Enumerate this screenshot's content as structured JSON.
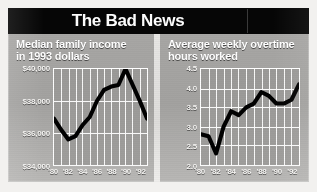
{
  "banner": {
    "title": "The Bad News"
  },
  "charts": [
    {
      "id": "median-family-income",
      "title": "Median family income\nin 1993 dollars"
    },
    {
      "id": "average-weekly-overtime",
      "title": "Average weekly overtime\nhours worked"
    }
  ],
  "chart_data": [
    {
      "type": "line",
      "id": "median-family-income",
      "title": "Median family income in 1993 dollars",
      "xlabel": "",
      "ylabel": "Median family income (1993 dollars)",
      "x": [
        1980,
        1981,
        1982,
        1983,
        1984,
        1985,
        1986,
        1987,
        1988,
        1989,
        1990,
        1991,
        1992,
        1993
      ],
      "values": [
        36900,
        36200,
        35600,
        35800,
        36500,
        37000,
        38000,
        38700,
        38900,
        39000,
        40000,
        39000,
        38000,
        36900
      ],
      "ytick_labels": [
        "$40,000",
        "$38,000",
        "$36,000",
        "$34,000"
      ],
      "ytick_values": [
        40000,
        38000,
        36000,
        34000
      ],
      "ylim": [
        34000,
        40000
      ],
      "xtick_labels": [
        "'80",
        "'82",
        "'84",
        "'86",
        "'88",
        "'90",
        "'92"
      ],
      "xtick_values": [
        1980,
        1982,
        1984,
        1986,
        1988,
        1990,
        1992
      ],
      "xlim": [
        1980,
        1993
      ],
      "grid": true,
      "legend": "none",
      "line_color": "#000000"
    },
    {
      "type": "line",
      "id": "average-weekly-overtime",
      "title": "Average weekly overtime hours worked",
      "xlabel": "",
      "ylabel": "Average weekly overtime hours",
      "x": [
        1980,
        1981,
        1982,
        1983,
        1984,
        1985,
        1986,
        1987,
        1988,
        1989,
        1990,
        1991,
        1992,
        1993
      ],
      "values": [
        2.8,
        2.75,
        2.3,
        3.0,
        3.4,
        3.3,
        3.5,
        3.6,
        3.9,
        3.8,
        3.6,
        3.6,
        3.7,
        4.1
      ],
      "ytick_labels": [
        "4.5",
        "4.0",
        "3.5",
        "3.0",
        "2.5",
        "2.0"
      ],
      "ytick_values": [
        4.5,
        4.0,
        3.5,
        3.0,
        2.5,
        2.0
      ],
      "ylim": [
        2.0,
        4.5
      ],
      "xtick_labels": [
        "'80",
        "'82",
        "'84",
        "'86",
        "'88",
        "'90",
        "'92"
      ],
      "xtick_values": [
        1980,
        1982,
        1984,
        1986,
        1988,
        1990,
        1992
      ],
      "xlim": [
        1980,
        1993
      ],
      "grid": true,
      "legend": "none",
      "line_color": "#000000"
    }
  ]
}
